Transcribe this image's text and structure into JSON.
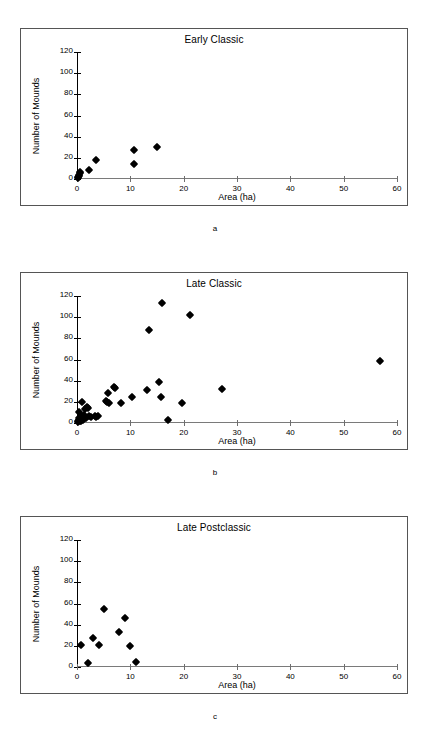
{
  "figure": {
    "panels": [
      {
        "caption": "a",
        "title": "Early Classic",
        "xlabel": "Area (ha)",
        "ylabel": "Number of Mounds"
      },
      {
        "caption": "b",
        "title": "Late Classic",
        "xlabel": "Area (ha)",
        "ylabel": "Number of Mounds"
      },
      {
        "caption": "c",
        "title": "Late Postclassic",
        "xlabel": "Area (ha)",
        "ylabel": "Number of Mounds"
      }
    ],
    "axis": {
      "x_ticks": [
        "0",
        "10",
        "20",
        "30",
        "40",
        "50",
        "60"
      ],
      "y_ticks": [
        "0",
        "20",
        "40",
        "60",
        "80",
        "100",
        "120"
      ]
    },
    "colors": {
      "marker": "#000000",
      "frame": "#555555",
      "axis": "#000000",
      "background": "#ffffff"
    }
  },
  "chart_data": [
    {
      "type": "scatter",
      "title": "Early Classic",
      "panel": "a",
      "xlabel": "Area (ha)",
      "ylabel": "Number of Mounds",
      "xlim": [
        0,
        60
      ],
      "ylim": [
        0,
        120
      ],
      "xticks": [
        0,
        10,
        20,
        30,
        40,
        50,
        60
      ],
      "yticks": [
        0,
        20,
        40,
        60,
        80,
        100,
        120
      ],
      "grid": false,
      "legend": false,
      "marker": "filled-diamond",
      "points": [
        {
          "x": 0.1,
          "y": 0.5
        },
        {
          "x": 0.2,
          "y": 1.5
        },
        {
          "x": 0.3,
          "y": 2.5
        },
        {
          "x": 0.35,
          "y": 4
        },
        {
          "x": 0.5,
          "y": 6
        },
        {
          "x": 0.6,
          "y": 7
        },
        {
          "x": 2.2,
          "y": 8.5
        },
        {
          "x": 3.6,
          "y": 17.5
        },
        {
          "x": 10.6,
          "y": 27.5
        },
        {
          "x": 10.6,
          "y": 14.5
        },
        {
          "x": 15.0,
          "y": 30.5
        }
      ]
    },
    {
      "type": "scatter",
      "title": "Late Classic",
      "panel": "b",
      "xlabel": "Area (ha)",
      "ylabel": "Number of Mounds",
      "xlim": [
        0,
        60
      ],
      "ylim": [
        0,
        120
      ],
      "xticks": [
        0,
        10,
        20,
        30,
        40,
        50,
        60
      ],
      "yticks": [
        0,
        20,
        40,
        60,
        80,
        100,
        120
      ],
      "grid": false,
      "legend": false,
      "marker": "filled-diamond",
      "points": [
        {
          "x": 0.15,
          "y": 1
        },
        {
          "x": 0.2,
          "y": 2
        },
        {
          "x": 0.3,
          "y": 3
        },
        {
          "x": 0.35,
          "y": 5
        },
        {
          "x": 0.4,
          "y": 10
        },
        {
          "x": 0.5,
          "y": 1.5
        },
        {
          "x": 0.6,
          "y": 4
        },
        {
          "x": 0.7,
          "y": 2
        },
        {
          "x": 0.9,
          "y": 19.5
        },
        {
          "x": 1.0,
          "y": 7
        },
        {
          "x": 1.1,
          "y": 3
        },
        {
          "x": 1.3,
          "y": 8
        },
        {
          "x": 1.5,
          "y": 13
        },
        {
          "x": 1.6,
          "y": 5
        },
        {
          "x": 1.9,
          "y": 15
        },
        {
          "x": 2.1,
          "y": 14
        },
        {
          "x": 2.3,
          "y": 7
        },
        {
          "x": 2.6,
          "y": 6
        },
        {
          "x": 3.3,
          "y": 7
        },
        {
          "x": 3.6,
          "y": 6
        },
        {
          "x": 3.9,
          "y": 6.5
        },
        {
          "x": 5.4,
          "y": 21
        },
        {
          "x": 5.6,
          "y": 20
        },
        {
          "x": 5.8,
          "y": 28
        },
        {
          "x": 6.0,
          "y": 19
        },
        {
          "x": 7.0,
          "y": 34
        },
        {
          "x": 7.2,
          "y": 33
        },
        {
          "x": 8.2,
          "y": 19
        },
        {
          "x": 10.4,
          "y": 25
        },
        {
          "x": 13.2,
          "y": 31
        },
        {
          "x": 13.5,
          "y": 88
        },
        {
          "x": 15.4,
          "y": 38.5
        },
        {
          "x": 15.7,
          "y": 25
        },
        {
          "x": 15.9,
          "y": 113
        },
        {
          "x": 17.0,
          "y": 3
        },
        {
          "x": 19.6,
          "y": 19
        },
        {
          "x": 21.1,
          "y": 102.5
        },
        {
          "x": 27.2,
          "y": 32.5
        },
        {
          "x": 56.8,
          "y": 58.5
        }
      ]
    },
    {
      "type": "scatter",
      "title": "Late Postclassic",
      "panel": "c",
      "xlabel": "Area (ha)",
      "ylabel": "Number of Mounds",
      "xlim": [
        0,
        60
      ],
      "ylim": [
        0,
        120
      ],
      "xticks": [
        0,
        10,
        20,
        30,
        40,
        50,
        60
      ],
      "yticks": [
        0,
        20,
        40,
        60,
        80,
        100,
        120
      ],
      "grid": false,
      "legend": false,
      "marker": "filled-diamond",
      "points": [
        {
          "x": 0.8,
          "y": 21
        },
        {
          "x": 2.0,
          "y": 4
        },
        {
          "x": 3.0,
          "y": 27.5
        },
        {
          "x": 4.1,
          "y": 20.5
        },
        {
          "x": 5.0,
          "y": 55
        },
        {
          "x": 7.9,
          "y": 33
        },
        {
          "x": 9.0,
          "y": 46.5
        },
        {
          "x": 9.9,
          "y": 20
        },
        {
          "x": 11.0,
          "y": 4.5
        }
      ]
    }
  ]
}
